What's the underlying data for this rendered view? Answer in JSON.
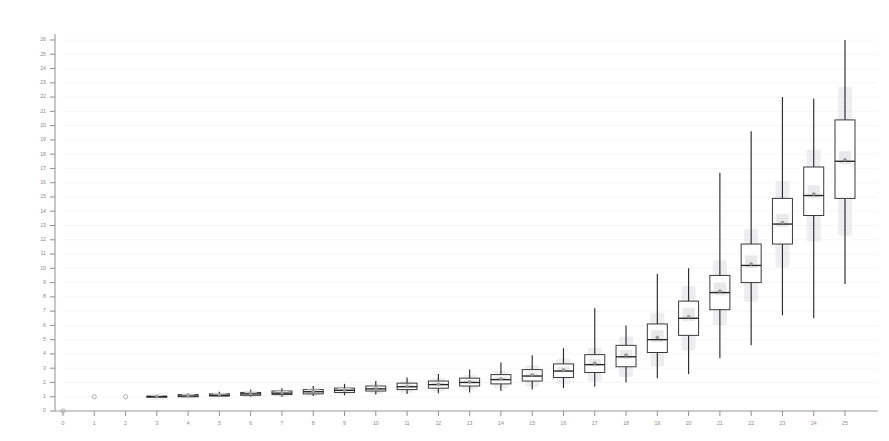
{
  "chart_data": {
    "type": "box",
    "title": "",
    "subtitle": "",
    "xlabel": "",
    "ylabel": "",
    "xlim": [
      -0.6,
      25.6
    ],
    "ylim": [
      0,
      26.6
    ],
    "grid": true,
    "legend": null,
    "x_ticks": [
      0,
      1,
      2,
      3,
      4,
      5,
      6,
      7,
      8,
      9,
      10,
      11,
      12,
      13,
      14,
      15,
      16,
      17,
      18,
      19,
      20,
      21,
      22,
      23,
      24,
      25
    ],
    "x_tick_labels": [
      "0",
      "1",
      "2",
      "3",
      "4",
      "5",
      "6",
      "7",
      "8",
      "9",
      "10",
      "11",
      "12",
      "13",
      "14",
      "15",
      "16",
      "17",
      "18",
      "19",
      "20",
      "21",
      "22",
      "23",
      "24",
      "25"
    ],
    "y_ticks": [
      0,
      1,
      2,
      3,
      4,
      5,
      6,
      7,
      8,
      9,
      10,
      11,
      12,
      13,
      14,
      15,
      16,
      17,
      18,
      19,
      20,
      21,
      22,
      23,
      24,
      25,
      26
    ],
    "y_tick_labels": [
      "0",
      "1",
      "2",
      "3",
      "4",
      "5",
      "6",
      "7",
      "8",
      "9",
      "10",
      "11",
      "12",
      "13",
      "14",
      "15",
      "16",
      "17",
      "18",
      "19",
      "20",
      "21",
      "22",
      "23",
      "24",
      "25",
      "26"
    ],
    "boxes": [
      {
        "x": 0,
        "whisker_low": 0.0,
        "q1": 0.0,
        "median": 0.0,
        "q3": 0.0,
        "whisker_high": 0.0,
        "mean": 0.0,
        "style": "point"
      },
      {
        "x": 1,
        "whisker_low": 1.0,
        "q1": 1.0,
        "median": 1.0,
        "q3": 1.0,
        "whisker_high": 1.0,
        "mean": 1.0,
        "style": "point"
      },
      {
        "x": 2,
        "whisker_low": 1.0,
        "q1": 1.0,
        "median": 1.0,
        "q3": 1.0,
        "whisker_high": 1.0,
        "mean": 1.0,
        "style": "point"
      },
      {
        "x": 3,
        "whisker_low": 1.0,
        "q1": 1.0,
        "median": 1.0,
        "q3": 1.05,
        "whisker_high": 1.1,
        "mean": 1.02,
        "style": "box"
      },
      {
        "x": 4,
        "whisker_low": 1.0,
        "q1": 1.0,
        "median": 1.05,
        "q3": 1.15,
        "whisker_high": 1.25,
        "mean": 1.07,
        "style": "box"
      },
      {
        "x": 5,
        "whisker_low": 1.0,
        "q1": 1.05,
        "median": 1.1,
        "q3": 1.2,
        "whisker_high": 1.35,
        "mean": 1.13,
        "style": "box"
      },
      {
        "x": 6,
        "whisker_low": 1.0,
        "q1": 1.1,
        "median": 1.2,
        "q3": 1.3,
        "whisker_high": 1.5,
        "mean": 1.21,
        "style": "box"
      },
      {
        "x": 7,
        "whisker_low": 1.0,
        "q1": 1.15,
        "median": 1.25,
        "q3": 1.4,
        "whisker_high": 1.6,
        "mean": 1.28,
        "style": "box"
      },
      {
        "x": 8,
        "whisker_low": 1.05,
        "q1": 1.2,
        "median": 1.35,
        "q3": 1.5,
        "whisker_high": 1.75,
        "mean": 1.37,
        "style": "box"
      },
      {
        "x": 9,
        "whisker_low": 1.1,
        "q1": 1.3,
        "median": 1.45,
        "q3": 1.6,
        "whisker_high": 1.9,
        "mean": 1.47,
        "style": "box"
      },
      {
        "x": 10,
        "whisker_low": 1.15,
        "q1": 1.4,
        "median": 1.55,
        "q3": 1.75,
        "whisker_high": 2.1,
        "mean": 1.58,
        "style": "box"
      },
      {
        "x": 11,
        "whisker_low": 1.2,
        "q1": 1.5,
        "median": 1.7,
        "q3": 1.95,
        "whisker_high": 2.35,
        "mean": 1.73,
        "style": "box"
      },
      {
        "x": 12,
        "whisker_low": 1.25,
        "q1": 1.6,
        "median": 1.85,
        "q3": 2.1,
        "whisker_high": 2.6,
        "mean": 1.88,
        "style": "box"
      },
      {
        "x": 13,
        "whisker_low": 1.3,
        "q1": 1.75,
        "median": 2.0,
        "q3": 2.3,
        "whisker_high": 2.9,
        "mean": 2.04,
        "style": "box"
      },
      {
        "x": 14,
        "whisker_low": 1.4,
        "q1": 1.9,
        "median": 2.2,
        "q3": 2.55,
        "whisker_high": 3.4,
        "mean": 2.25,
        "style": "box"
      },
      {
        "x": 15,
        "whisker_low": 1.5,
        "q1": 2.1,
        "median": 2.45,
        "q3": 2.9,
        "whisker_high": 3.9,
        "mean": 2.52,
        "style": "box"
      },
      {
        "x": 16,
        "whisker_low": 1.6,
        "q1": 2.35,
        "median": 2.8,
        "q3": 3.3,
        "whisker_high": 4.4,
        "mean": 2.87,
        "style": "box"
      },
      {
        "x": 17,
        "whisker_low": 1.7,
        "q1": 2.7,
        "median": 3.25,
        "q3": 3.95,
        "whisker_high": 7.2,
        "mean": 3.35,
        "style": "box"
      },
      {
        "x": 18,
        "whisker_low": 2.0,
        "q1": 3.1,
        "median": 3.8,
        "q3": 4.6,
        "whisker_high": 6.0,
        "mean": 3.92,
        "style": "box"
      },
      {
        "x": 19,
        "whisker_low": 2.3,
        "q1": 4.1,
        "median": 5.0,
        "q3": 6.1,
        "whisker_high": 9.6,
        "mean": 5.15,
        "style": "box"
      },
      {
        "x": 20,
        "whisker_low": 2.6,
        "q1": 5.3,
        "median": 6.5,
        "q3": 7.7,
        "whisker_high": 10.0,
        "mean": 6.6,
        "style": "box"
      },
      {
        "x": 21,
        "whisker_low": 3.7,
        "q1": 7.1,
        "median": 8.3,
        "q3": 9.5,
        "whisker_high": 16.7,
        "mean": 8.4,
        "style": "box"
      },
      {
        "x": 22,
        "whisker_low": 4.6,
        "q1": 9.0,
        "median": 10.2,
        "q3": 11.7,
        "whisker_high": 19.6,
        "mean": 10.3,
        "style": "box"
      },
      {
        "x": 23,
        "whisker_low": 6.7,
        "q1": 11.7,
        "median": 13.1,
        "q3": 14.9,
        "whisker_high": 22.0,
        "mean": 13.2,
        "style": "box"
      },
      {
        "x": 24,
        "whisker_low": 6.5,
        "q1": 13.7,
        "median": 15.1,
        "q3": 17.1,
        "whisker_high": 21.9,
        "mean": 15.2,
        "style": "box"
      },
      {
        "x": 25,
        "whisker_low": 8.9,
        "q1": 14.9,
        "median": 17.5,
        "q3": 20.4,
        "whisker_high": 26.0,
        "mean": 17.6,
        "style": "box"
      }
    ],
    "colors": {
      "box_fill": "#ffffff",
      "box_stroke": "#3a3a3a",
      "median": "#222222",
      "whisker": "#2b2b2b",
      "notch_band": "#e4e4e6",
      "mean_marker": "#9d9d9d",
      "axis": "#9a9a9a",
      "tick_text": "#8b8b8b",
      "grid": "#f4f4f6",
      "background": "#ffffff"
    }
  }
}
